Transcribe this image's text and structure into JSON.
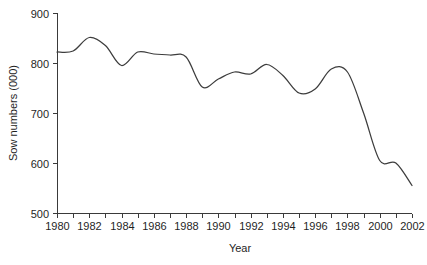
{
  "chart_data": {
    "type": "line",
    "title": "",
    "xlabel": "Year",
    "ylabel": "Sow numbers (000)",
    "xlim": [
      1980,
      2002
    ],
    "ylim": [
      500,
      900
    ],
    "grid": false,
    "legend": "none",
    "y_ticks": [
      500,
      600,
      700,
      800,
      900
    ],
    "y_tick_labels": [
      "500",
      "600",
      "700",
      "800",
      "900"
    ],
    "x_ticks": [
      1980,
      1981,
      1982,
      1983,
      1984,
      1985,
      1986,
      1987,
      1988,
      1989,
      1990,
      1991,
      1992,
      1993,
      1994,
      1995,
      1996,
      1997,
      1998,
      1999,
      2000,
      2001,
      2002
    ],
    "x_tick_labels": [
      "1980",
      "",
      "1982",
      "",
      "1984",
      "",
      "1986",
      "",
      "1988",
      "",
      "1990",
      "",
      "1992",
      "",
      "1994",
      "",
      "1996",
      "",
      "1998",
      "",
      "2000",
      "",
      "2002"
    ],
    "x_labeled_ticks": [
      1980,
      1982,
      1984,
      1986,
      1988,
      1990,
      1992,
      1994,
      1996,
      1998,
      2000,
      2002
    ],
    "x": [
      1980,
      1981,
      1982,
      1983,
      1984,
      1985,
      1986,
      1987,
      1988,
      1989,
      1990,
      1991,
      1992,
      1993,
      1994,
      1995,
      1996,
      1997,
      1998,
      1999,
      2000,
      2001,
      2002
    ],
    "values": [
      822,
      824,
      851,
      835,
      795,
      822,
      818,
      816,
      812,
      752,
      768,
      782,
      778,
      797,
      775,
      740,
      748,
      788,
      782,
      700,
      605,
      600,
      555
    ],
    "series": [
      {
        "name": "Sow numbers",
        "color": "#3d3d3d",
        "values": [
          822,
          824,
          851,
          835,
          795,
          822,
          818,
          816,
          812,
          752,
          768,
          782,
          778,
          797,
          775,
          740,
          748,
          788,
          782,
          700,
          605,
          600,
          555
        ]
      }
    ],
    "colors": {
      "line": "#3d3d3d",
      "axis": "#3a3a3a",
      "text": "#1f1f1f",
      "background": "#ffffff"
    }
  },
  "geometry": {
    "plot_left": 57,
    "plot_right": 412,
    "plot_top": 13,
    "plot_bottom": 213
  }
}
